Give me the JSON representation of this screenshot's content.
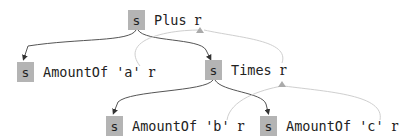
{
  "diagram": {
    "nodes": [
      {
        "id": "plus",
        "sbox": "s",
        "label": "Plus",
        "rmark": "r"
      },
      {
        "id": "amt_a",
        "sbox": "s",
        "label": "AmountOf 'a'",
        "rmark": "r"
      },
      {
        "id": "times",
        "sbox": "s",
        "label": "Times",
        "rmark": "r"
      },
      {
        "id": "amt_b",
        "sbox": "s",
        "label": "AmountOf 'b'",
        "rmark": "r"
      },
      {
        "id": "amt_c",
        "sbox": "s",
        "label": "AmountOf 'c'",
        "rmark": "r"
      }
    ],
    "edges": [
      {
        "from": "plus",
        "to": "amt_a",
        "kind": "child"
      },
      {
        "from": "plus",
        "to": "times",
        "kind": "child"
      },
      {
        "from": "times",
        "to": "amt_b",
        "kind": "child"
      },
      {
        "from": "times",
        "to": "amt_c",
        "kind": "child"
      },
      {
        "from": "amt_a",
        "to": "plus",
        "kind": "return"
      },
      {
        "from": "times",
        "to": "plus",
        "kind": "return"
      },
      {
        "from": "amt_b",
        "to": "times",
        "kind": "return"
      },
      {
        "from": "amt_c",
        "to": "times",
        "kind": "return"
      }
    ],
    "colors": {
      "sbox": "#b4b4b4",
      "child_edge": "#444444",
      "return_edge": "#cfcfcf"
    }
  }
}
